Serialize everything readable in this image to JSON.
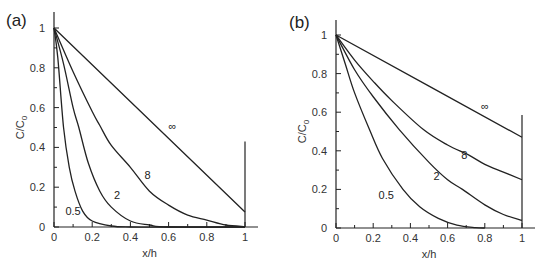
{
  "chart_data": [
    {
      "panel": "(a)",
      "type": "line",
      "title": "",
      "xlabel": "x/h",
      "ylabel": "C/C0",
      "xlim": [
        0,
        1
      ],
      "ylim": [
        0,
        1
      ],
      "xticks": [
        "0",
        "0.2",
        "0.4",
        "0.6",
        "0.8",
        "1"
      ],
      "yticks": [
        "0",
        "0.2",
        "0.4",
        "0.6",
        "0.8",
        "1"
      ],
      "grid": false,
      "legend": "inline curve labels",
      "series": [
        {
          "name": "0.5",
          "x": [
            0,
            0.02,
            0.05,
            0.08,
            0.11,
            0.15,
            0.2,
            0.3,
            0.4,
            0.6,
            1.0
          ],
          "y": [
            1,
            0.85,
            0.5,
            0.3,
            0.18,
            0.08,
            0.03,
            0.005,
            0,
            0,
            0
          ],
          "label_pos": [
            0.1,
            0.08
          ]
        },
        {
          "name": "2",
          "x": [
            0,
            0.05,
            0.1,
            0.13,
            0.18,
            0.24,
            0.3,
            0.4,
            0.5,
            0.6,
            1.0
          ],
          "y": [
            1,
            0.82,
            0.6,
            0.5,
            0.32,
            0.18,
            0.1,
            0.03,
            0.01,
            0,
            0
          ],
          "label_pos": [
            0.33,
            0.16
          ]
        },
        {
          "name": "8",
          "x": [
            0,
            0.1,
            0.2,
            0.24,
            0.3,
            0.4,
            0.5,
            0.6,
            0.7,
            0.8,
            0.9,
            1.0
          ],
          "y": [
            1,
            0.78,
            0.58,
            0.51,
            0.41,
            0.3,
            0.18,
            0.11,
            0.06,
            0.035,
            0.01,
            0.002
          ],
          "label_pos": [
            0.49,
            0.26
          ]
        },
        {
          "name": "∞",
          "x": [
            0,
            1.0
          ],
          "y": [
            1,
            0.075
          ],
          "label_pos": [
            0.62,
            0.51
          ]
        }
      ],
      "boundary_line": {
        "x": 1,
        "y_top": 0.43
      }
    },
    {
      "panel": "(b)",
      "type": "line",
      "title": "",
      "xlabel": "x/h",
      "ylabel": "C/C0",
      "xlim": [
        0,
        1
      ],
      "ylim": [
        0,
        1
      ],
      "xticks": [
        "0",
        "0.2",
        "0.4",
        "0.6",
        "0.8",
        "1"
      ],
      "yticks": [
        "0",
        "0.2",
        "0.4",
        "0.6",
        "0.8",
        "1"
      ],
      "grid": false,
      "legend": "inline curve labels",
      "series": [
        {
          "name": "0.5",
          "x": [
            0,
            0.05,
            0.1,
            0.18,
            0.25,
            0.36,
            0.45,
            0.55,
            0.65,
            0.75,
            0.8
          ],
          "y": [
            1,
            0.85,
            0.7,
            0.51,
            0.36,
            0.2,
            0.11,
            0.05,
            0.015,
            0.002,
            0
          ],
          "label_pos": [
            0.27,
            0.17
          ]
        },
        {
          "name": "2",
          "x": [
            0,
            0.1,
            0.2,
            0.34,
            0.5,
            0.6,
            0.68,
            0.8,
            0.9,
            1.0
          ],
          "y": [
            1,
            0.82,
            0.68,
            0.51,
            0.34,
            0.25,
            0.2,
            0.12,
            0.07,
            0.04
          ],
          "label_pos": [
            0.54,
            0.27
          ]
        },
        {
          "name": "8",
          "x": [
            0,
            0.1,
            0.2,
            0.3,
            0.47,
            0.6,
            0.71,
            0.8,
            0.9,
            1.0
          ],
          "y": [
            1,
            0.87,
            0.76,
            0.66,
            0.51,
            0.43,
            0.38,
            0.33,
            0.29,
            0.25
          ],
          "label_pos": [
            0.69,
            0.38
          ]
        },
        {
          "name": "∞",
          "x": [
            0,
            1.0
          ],
          "y": [
            1,
            0.47
          ],
          "label_pos": [
            0.8,
            0.63
          ]
        }
      ],
      "boundary_line": {
        "x": 1,
        "y_top": 0.585
      }
    }
  ],
  "panels": [
    {
      "label": "(a)",
      "xlabel": "x/h",
      "ylabel_main": "C/C",
      "ylabel_sub": "0"
    },
    {
      "label": "(b)",
      "xlabel": "x/h",
      "ylabel_main": "C/C",
      "ylabel_sub": "0"
    }
  ]
}
